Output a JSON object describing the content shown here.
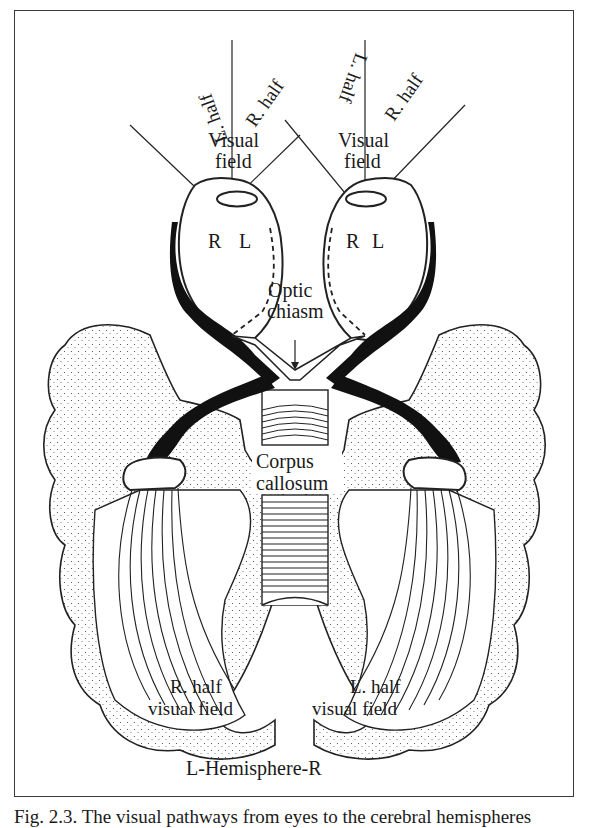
{
  "figure": {
    "labels": {
      "left_eye_field": {
        "left_half": "L. half",
        "right_half": "R. half",
        "visual": "Visual",
        "field": "field"
      },
      "right_eye_field": {
        "left_half": "L. half",
        "right_half": "R. half",
        "visual": "Visual",
        "field": "field"
      },
      "left_eye_retina": {
        "r": "R",
        "l": "L"
      },
      "right_eye_retina": {
        "r": "R",
        "l": "L"
      },
      "optic_chiasm": {
        "line1": "Optic",
        "line2": "chiasm"
      },
      "corpus_callosum": {
        "line1": "Corpus",
        "line2": "callosum"
      },
      "left_hemisphere_field": {
        "line1": "R. half",
        "line2": "visual field"
      },
      "right_hemisphere_field": {
        "line1": "L. half",
        "line2": "visual field"
      },
      "hemisphere_axis": "L-Hemisphere-R"
    },
    "caption": "Fig. 2.3. The visual pathways from eyes to the cerebral hemispheres"
  }
}
